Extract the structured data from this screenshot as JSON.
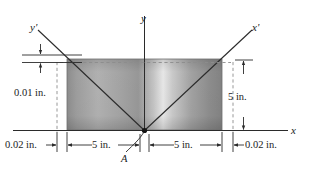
{
  "figure": {
    "type": "engineering-dimension-diagram",
    "axes": {
      "x_label": "x",
      "y_label": "y",
      "x_prime_label": "x'",
      "y_prime_label": "y'"
    },
    "points": {
      "origin_label": "A"
    },
    "dimensions": [
      {
        "name": "left-offset",
        "text": "0.02 in.",
        "value": 0.02,
        "unit": "in."
      },
      {
        "name": "left-half-width",
        "text": "5 in.",
        "value": 5,
        "unit": "in."
      },
      {
        "name": "right-half-width",
        "text": "5 in.",
        "value": 5,
        "unit": "in."
      },
      {
        "name": "right-offset",
        "text": "0.02 in.",
        "value": 0.02,
        "unit": "in."
      },
      {
        "name": "top-tolerance",
        "text": "0.01 in.",
        "value": 0.01,
        "unit": "in."
      },
      {
        "name": "height",
        "text": "5 in.",
        "value": 5,
        "unit": "in."
      }
    ],
    "colors": {
      "line": "#2b2b2b",
      "dashed": "#8c8c8c",
      "text": "#1a1a1a",
      "fill_light": "#e8e8e8",
      "fill_dark": "#8e8e8e"
    }
  }
}
